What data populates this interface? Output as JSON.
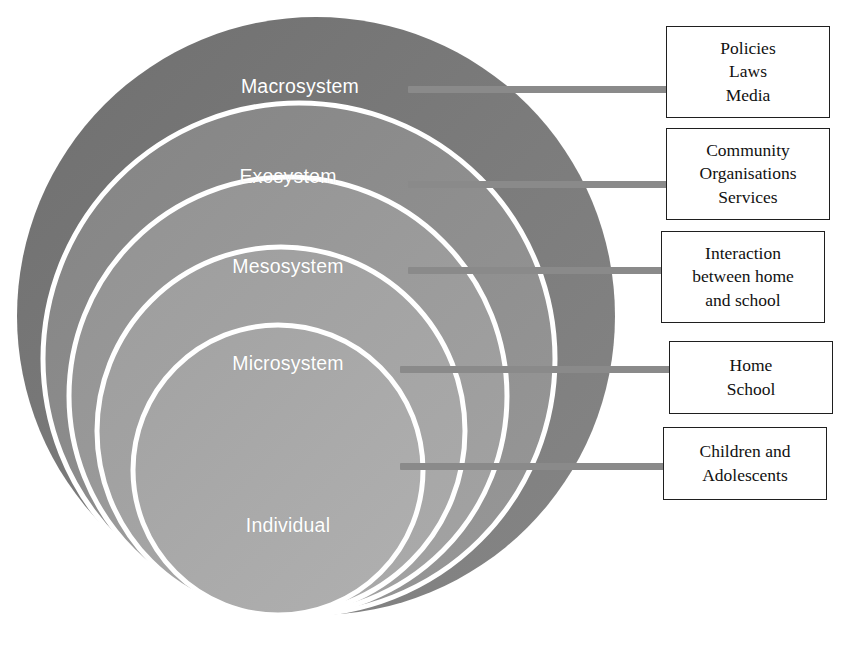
{
  "diagram": {
    "background": "#ffffff",
    "rings": [
      {
        "id": "macrosystem",
        "label": "Macrosystem",
        "fill": "#787878",
        "stroke": "#ffffff",
        "label_x": 300,
        "label_y": 75
      },
      {
        "id": "exosystem",
        "label": "Exosystem",
        "fill": "#8a8a8a",
        "stroke": "#ffffff",
        "label_x": 288,
        "label_y": 165
      },
      {
        "id": "mesosystem",
        "label": "Mesosystem",
        "fill": "#999999",
        "stroke": "#ffffff",
        "label_x": 288,
        "label_y": 255
      },
      {
        "id": "microsystem",
        "label": "Microsystem",
        "fill": "#a3a3a3",
        "stroke": "#ffffff",
        "label_x": 288,
        "label_y": 352
      },
      {
        "id": "individual",
        "label": "Individual",
        "fill": "#a8a8a8",
        "stroke": "#ffffff",
        "label_x": 288,
        "label_y": 514
      }
    ],
    "connectors": [
      {
        "id": "connector-macrosystem",
        "x": 408,
        "y": 86,
        "width": 262,
        "color": "#8a8a8a"
      },
      {
        "id": "connector-exosystem",
        "x": 408,
        "y": 181,
        "width": 262,
        "color": "#8a8a8a"
      },
      {
        "id": "connector-mesosystem",
        "x": 408,
        "y": 267,
        "width": 262,
        "color": "#8a8a8a"
      },
      {
        "id": "connector-microsystem",
        "x": 400,
        "y": 366,
        "width": 270,
        "color": "#8a8a8a"
      },
      {
        "id": "connector-individual",
        "x": 400,
        "y": 463,
        "width": 270,
        "color": "#8a8a8a"
      }
    ],
    "boxes": [
      {
        "id": "box-macrosystem",
        "lines": [
          "Policies",
          "Laws",
          "Media"
        ],
        "x": 666,
        "y": 26,
        "width": 164,
        "height": 92
      },
      {
        "id": "box-exosystem",
        "lines": [
          "Community",
          "Organisations",
          "Services"
        ],
        "x": 666,
        "y": 128,
        "width": 164,
        "height": 92
      },
      {
        "id": "box-mesosystem",
        "lines": [
          "Interaction",
          "between home",
          "and school"
        ],
        "x": 661,
        "y": 231,
        "width": 164,
        "height": 92
      },
      {
        "id": "box-microsystem",
        "lines": [
          "Home",
          "School"
        ],
        "x": 669,
        "y": 341,
        "width": 164,
        "height": 73
      },
      {
        "id": "box-individual",
        "lines": [
          "Children and",
          "Adolescents"
        ],
        "x": 663,
        "y": 427,
        "width": 164,
        "height": 73
      }
    ]
  }
}
